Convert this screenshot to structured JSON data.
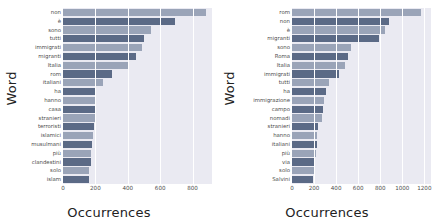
{
  "figure": {
    "background": "#ffffff",
    "plot_background": "#eaeaf2",
    "grid_color": "#ffffff",
    "color_light": "#9aa4b8",
    "color_dark": "#5b6a86"
  },
  "chart_data": [
    {
      "type": "bar",
      "orientation": "horizontal",
      "panel": "left",
      "title": "",
      "xlabel": "Occurrences",
      "ylabel": "Word",
      "xlim": [
        0,
        920
      ],
      "xticks": [
        0,
        200,
        400,
        600,
        800
      ],
      "xticklabels": [
        "0",
        "200",
        "400",
        "600",
        "800"
      ],
      "grid": true,
      "legend": "none",
      "categories": [
        "non",
        "è",
        "sono",
        "tutti",
        "immigrati",
        "migranti",
        "Italia",
        "rom",
        "italiani",
        "ha",
        "hanno",
        "casa",
        "stranieri",
        "terroristi",
        "islamici",
        "musulmani",
        "più",
        "clandestini",
        "solo",
        "islam"
      ],
      "values": [
        880,
        690,
        545,
        500,
        485,
        450,
        405,
        300,
        245,
        205,
        200,
        198,
        195,
        193,
        188,
        180,
        175,
        172,
        160,
        158
      ],
      "bar_colors": [
        "light",
        "dark",
        "light",
        "dark",
        "light",
        "dark",
        "light",
        "dark",
        "light",
        "dark",
        "light",
        "dark",
        "light",
        "dark",
        "light",
        "dark",
        "light",
        "dark",
        "light",
        "dark"
      ]
    },
    {
      "type": "bar",
      "orientation": "horizontal",
      "panel": "right",
      "title": "",
      "xlabel": "Occurrences",
      "ylabel": "Word",
      "xlim": [
        0,
        1260
      ],
      "xticks": [
        0,
        200,
        400,
        600,
        800,
        1000,
        1200
      ],
      "xticklabels": [
        "0",
        "200",
        "400",
        "600",
        "800",
        "1000",
        "1200"
      ],
      "grid": true,
      "legend": "none",
      "categories": [
        "rom",
        "non",
        "è",
        "migranti",
        "sono",
        "Roma",
        "Italia",
        "immigrati",
        "tutti",
        "ha",
        "immigrazione",
        "campo",
        "nomadi",
        "stranieri",
        "hanno",
        "italiani",
        "più",
        "via",
        "solo",
        "Salvini"
      ],
      "values": [
        1170,
        880,
        840,
        790,
        535,
        510,
        480,
        430,
        335,
        310,
        290,
        280,
        270,
        235,
        230,
        225,
        215,
        210,
        195,
        190
      ],
      "bar_colors": [
        "light",
        "dark",
        "light",
        "dark",
        "light",
        "dark",
        "light",
        "dark",
        "light",
        "dark",
        "light",
        "dark",
        "light",
        "dark",
        "light",
        "dark",
        "light",
        "dark",
        "light",
        "dark"
      ]
    }
  ]
}
